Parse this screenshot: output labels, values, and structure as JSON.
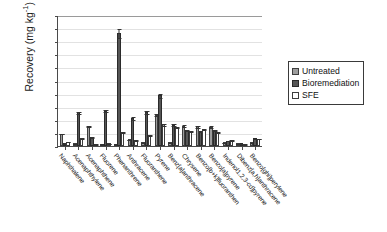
{
  "chart_data": {
    "type": "bar",
    "title": "",
    "xlabel": "",
    "ylabel": "Recovery (mg kg",
    "ylabel_sup": "-1",
    "ylabel_suffix": ")",
    "ylim": [
      0,
      500
    ],
    "yticks": [
      500,
      450,
      400,
      350,
      300,
      250,
      200,
      150,
      100,
      50,
      0
    ],
    "grid": true,
    "legend_position": "right",
    "categories": [
      "Naphthalene",
      "Acenaphthylene",
      "Acenaphthene",
      "Fluorene",
      "Phenanthrene",
      "Anthracene",
      "Fluoranthene",
      "Pyrene",
      "Benz[a]anthracene",
      "Chrysene",
      "Benzo[b+k]fluoranthen",
      "Benzo[a]pyrene",
      "Indenol1,2,3-cd]pyrene",
      "Dibenz[a,h]anthracene",
      "Benzo[ghi]perylene"
    ],
    "series": [
      {
        "name": "Untreated",
        "color": "#9d9d9d",
        "values": [
          47,
          10,
          78,
          4,
          6,
          25,
          14,
          120,
          14,
          78,
          75,
          74,
          14,
          11,
          14
        ],
        "errors": [
          3,
          2,
          4,
          1,
          2,
          3,
          2,
          6,
          2,
          5,
          5,
          5,
          2,
          2,
          2
        ]
      },
      {
        "name": "Bioremediation",
        "color": "#565656",
        "values": [
          12,
          128,
          34,
          135,
          432,
          108,
          131,
          193,
          82,
          60,
          57,
          62,
          21,
          10,
          29
        ],
        "errors": [
          3,
          7,
          3,
          7,
          18,
          7,
          8,
          10,
          5,
          4,
          4,
          4,
          3,
          2,
          3
        ]
      },
      {
        "name": "SFE",
        "color": "#ffffff",
        "values": [
          16,
          31,
          5,
          11,
          53,
          22,
          43,
          83,
          73,
          58,
          65,
          54,
          22,
          6,
          28
        ],
        "errors": [
          2,
          3,
          1,
          2,
          4,
          3,
          4,
          6,
          5,
          4,
          4,
          4,
          3,
          1,
          3
        ]
      }
    ]
  },
  "legend": {
    "items": [
      {
        "label": "Untreated"
      },
      {
        "label": "Bioremediation"
      },
      {
        "label": "SFE"
      }
    ]
  }
}
